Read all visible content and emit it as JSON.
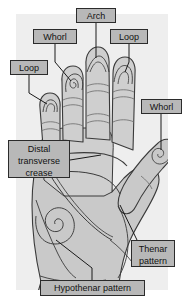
{
  "figure": {
    "background_color": "#ffffff",
    "plate_color": "#eeeeee",
    "skin_fill": "#c9c9c9",
    "skin_fill_light": "#d8d8d8",
    "line_color": "#3a3a3a",
    "label_fill": "#b8b8b8",
    "label_border": "#2b2b2b",
    "label_text_color": "#111111"
  },
  "labels": {
    "loop_index": "Loop",
    "whorl_middle": "Whorl",
    "arch": "Arch",
    "loop_ring": "Loop",
    "whorl_thumb": "Whorl",
    "distal_transverse_crease": "Distal transverse crease",
    "thenar_pattern": "Thenar pattern",
    "hypothenar_pattern": "Hypothenar pattern"
  },
  "annotations": [
    {
      "id": "loop-index",
      "text": "Loop",
      "target": "index-finger-tip",
      "pattern": "loop"
    },
    {
      "id": "whorl-middle",
      "text": "Whorl",
      "target": "middle-finger-tip",
      "pattern": "whorl"
    },
    {
      "id": "arch",
      "text": "Arch",
      "target": "ring-finger-tip",
      "pattern": "arch"
    },
    {
      "id": "loop-ring",
      "text": "Loop",
      "target": "little-finger-tip",
      "pattern": "loop"
    },
    {
      "id": "whorl-thumb",
      "text": "Whorl",
      "target": "thumb-tip",
      "pattern": "whorl"
    },
    {
      "id": "distal-crease",
      "text": "Distal transverse crease",
      "target": "palm-crease",
      "pattern": "crease"
    },
    {
      "id": "thenar",
      "text": "Thenar pattern",
      "target": "thenar-eminence",
      "pattern": "thenar"
    },
    {
      "id": "hypothenar",
      "text": "Hypothenar pattern",
      "target": "hypothenar-eminence",
      "pattern": "whorl"
    }
  ]
}
